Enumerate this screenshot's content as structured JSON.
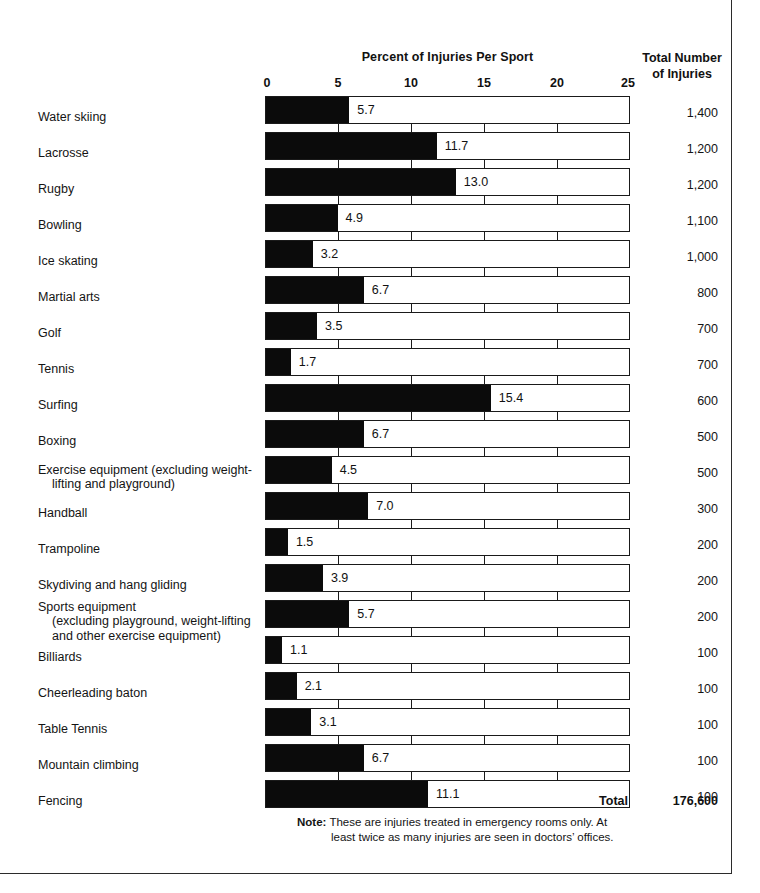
{
  "header": {
    "chart_title": "Percent of Injuries Per Sport",
    "totals_title_line1": "Total Number",
    "totals_title_line2": "of Injuries"
  },
  "footer": {
    "total_label": "Total",
    "total_value": "176,600",
    "note_label": "Note:",
    "note_line1": "These are injuries treated in emergency rooms only. At",
    "note_line2": "least twice as many injuries are seen in doctors’ offices."
  },
  "colors": {
    "bar_fill": "#0b0b0b",
    "bar_outline": "#1a1a1a",
    "text": "#141414",
    "frame": "#2b2b2b"
  },
  "chart_data": {
    "type": "bar",
    "title": "Percent of Injuries Per Sport",
    "xlabel": "Percent of Injuries Per Sport",
    "ylabel": "",
    "xlim": [
      0,
      25
    ],
    "ticks": [
      0,
      5,
      10,
      15,
      20,
      25
    ],
    "tick_labels": [
      "0",
      "5",
      "10",
      "15",
      "20",
      "25"
    ],
    "grid": false,
    "legend": "none",
    "orientation": "horizontal",
    "value_label_suffix": "",
    "categories": [
      "Water skiing",
      "Lacrosse",
      "Rugby",
      "Bowling",
      "Ice skating",
      "Martial arts",
      "Golf",
      "Tennis",
      "Surfing",
      "Boxing",
      "Exercise equipment (excluding weight-lifting and playground)",
      "Handball",
      "Trampoline",
      "Skydiving and hang gliding",
      "Sports equipment (excluding playground, weight-lifting and other exercise equipment)",
      "Billiards",
      "Cheerleading baton",
      "Table Tennis",
      "Mountain climbing",
      "Fencing"
    ],
    "values": [
      5.7,
      11.7,
      13.0,
      4.9,
      3.2,
      6.7,
      3.5,
      1.7,
      15.4,
      6.7,
      4.5,
      7.0,
      1.5,
      3.9,
      5.7,
      1.1,
      2.1,
      3.1,
      6.7,
      11.1
    ],
    "value_labels": [
      "5.7",
      "11.7",
      "13.0",
      "4.9",
      "3.2",
      "6.7",
      "3.5",
      "1.7",
      "15.4",
      "6.7",
      "4.5",
      "7.0",
      "1.5",
      "3.9",
      "5.7",
      "1.1",
      "2.1",
      "3.1",
      "6.7",
      "11.1"
    ],
    "totals": [
      "1,400",
      "1,200",
      "1,200",
      "1,100",
      "1,000",
      "800",
      "700",
      "700",
      "600",
      "500",
      "500",
      "300",
      "200",
      "200",
      "200",
      "100",
      "100",
      "100",
      "100",
      "100"
    ],
    "total_sum": "176,600"
  },
  "rows": [
    {
      "label": "Water skiing",
      "label_lines": [
        "Water skiing"
      ],
      "value": 5.7,
      "value_label": "5.7",
      "total": "1,400"
    },
    {
      "label": "Lacrosse",
      "label_lines": [
        "Lacrosse"
      ],
      "value": 11.7,
      "value_label": "11.7",
      "total": "1,200"
    },
    {
      "label": "Rugby",
      "label_lines": [
        "Rugby"
      ],
      "value": 13.0,
      "value_label": "13.0",
      "total": "1,200"
    },
    {
      "label": "Bowling",
      "label_lines": [
        "Bowling"
      ],
      "value": 4.9,
      "value_label": "4.9",
      "total": "1,100"
    },
    {
      "label": "Ice skating",
      "label_lines": [
        "Ice skating"
      ],
      "value": 3.2,
      "value_label": "3.2",
      "total": "1,000"
    },
    {
      "label": "Martial arts",
      "label_lines": [
        "Martial  arts"
      ],
      "value": 6.7,
      "value_label": "6.7",
      "total": "800"
    },
    {
      "label": "Golf",
      "label_lines": [
        "Golf"
      ],
      "value": 3.5,
      "value_label": "3.5",
      "total": "700"
    },
    {
      "label": "Tennis",
      "label_lines": [
        "Tennis"
      ],
      "value": 1.7,
      "value_label": "1.7",
      "total": "700"
    },
    {
      "label": "Surfing",
      "label_lines": [
        "Surfing"
      ],
      "value": 15.4,
      "value_label": "15.4",
      "total": "600"
    },
    {
      "label": "Boxing",
      "label_lines": [
        "Boxing"
      ],
      "value": 6.7,
      "value_label": "6.7",
      "total": "500"
    },
    {
      "label": "Exercise equipment (excluding weight-lifting and playground)",
      "label_lines": [
        "Exercise equipment (excluding weight-",
        "lifting and playground)"
      ],
      "value": 4.5,
      "value_label": "4.5",
      "total": "500"
    },
    {
      "label": "Handball",
      "label_lines": [
        "Handball"
      ],
      "value": 7.0,
      "value_label": "7.0",
      "total": "300"
    },
    {
      "label": "Trampoline",
      "label_lines": [
        "Trampoline"
      ],
      "value": 1.5,
      "value_label": "1.5",
      "total": "200"
    },
    {
      "label": "Skydiving and hang gliding",
      "label_lines": [
        "Skydiving and hang gliding"
      ],
      "value": 3.9,
      "value_label": "3.9",
      "total": "200"
    },
    {
      "label": "Sports equipment (excluding playground, weight-lifting and other exercise equipment)",
      "label_lines": [
        "Sports equipment",
        "(excluding playground,  weight-lifting",
        "and other exercise equipment)"
      ],
      "value": 5.7,
      "value_label": "5.7",
      "total": "200"
    },
    {
      "label": "Billiards",
      "label_lines": [
        "Billiards"
      ],
      "value": 1.1,
      "value_label": "1.1",
      "total": "100"
    },
    {
      "label": "Cheerleading baton",
      "label_lines": [
        "Cheerleading baton"
      ],
      "value": 2.1,
      "value_label": "2.1",
      "total": "100"
    },
    {
      "label": "Table Tennis",
      "label_lines": [
        "Table Tennis"
      ],
      "value": 3.1,
      "value_label": "3.1",
      "total": "100"
    },
    {
      "label": "Mountain climbing",
      "label_lines": [
        "Mountain climbing"
      ],
      "value": 6.7,
      "value_label": "6.7",
      "total": "100"
    },
    {
      "label": "Fencing",
      "label_lines": [
        "Fencing"
      ],
      "value": 11.1,
      "value_label": "11.1",
      "total": "100"
    }
  ]
}
